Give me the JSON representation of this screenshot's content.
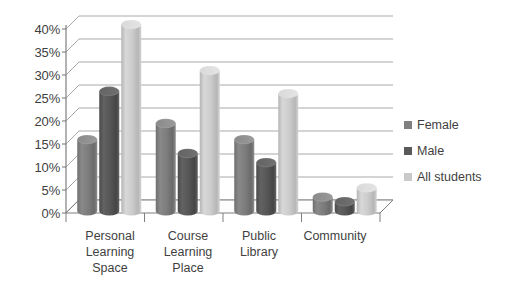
{
  "chart_data": {
    "type": "bar",
    "title": "",
    "subtitle": "",
    "xlabel": "",
    "ylabel": "",
    "categories": [
      "Personal\nLearning\nSpace",
      "Course\nLearning\nPlace",
      "Public\nLibrary",
      "Community"
    ],
    "series": [
      {
        "name": "Female",
        "color": "#808080",
        "values": [
          16,
          19.5,
          16,
          3.5
        ]
      },
      {
        "name": "Male",
        "color": "#595959",
        "values": [
          26.5,
          13,
          11,
          2.5
        ]
      },
      {
        "name": "All students",
        "color": "#c9c9c9",
        "values": [
          41,
          31,
          26,
          5.5
        ]
      }
    ],
    "ylim": [
      0,
      40
    ],
    "yticks": [
      "0%",
      "5%",
      "10%",
      "15%",
      "20%",
      "25%",
      "30%",
      "35%",
      "40%"
    ],
    "ytick_values": [
      0,
      5,
      10,
      15,
      20,
      25,
      30,
      35,
      40
    ],
    "grid": true,
    "grid_color": "#9a9a9a",
    "legend_position": "right",
    "legend": [
      "Female",
      "Male",
      "All students"
    ],
    "style": "3d-cylinder",
    "background": "#ffffff",
    "axis_color": "#7f7f7f",
    "text_color": "#3f3f3f"
  }
}
